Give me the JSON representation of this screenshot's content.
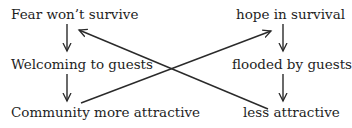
{
  "diagram": {
    "type": "cycle-diagram",
    "left_column": {
      "nodes": [
        {
          "id": "L1",
          "label": "Fear won’t survive"
        },
        {
          "id": "L2",
          "label": "Welcoming to guests"
        },
        {
          "id": "L3",
          "label": "Community more attractive"
        }
      ]
    },
    "right_column": {
      "nodes": [
        {
          "id": "R1",
          "label": "hope in survival"
        },
        {
          "id": "R2",
          "label": "flooded by guests"
        },
        {
          "id": "R3",
          "label": "less attractive"
        }
      ]
    },
    "edges": [
      {
        "from": "L1",
        "to": "L2"
      },
      {
        "from": "L2",
        "to": "L3"
      },
      {
        "from": "R1",
        "to": "R2"
      },
      {
        "from": "R2",
        "to": "R3"
      },
      {
        "from": "L3",
        "to": "R1"
      },
      {
        "from": "R3",
        "to": "L1"
      }
    ],
    "colors": {
      "text": "#1e1e1e",
      "line": "#2a2a2a",
      "background": "#ffffff"
    }
  }
}
